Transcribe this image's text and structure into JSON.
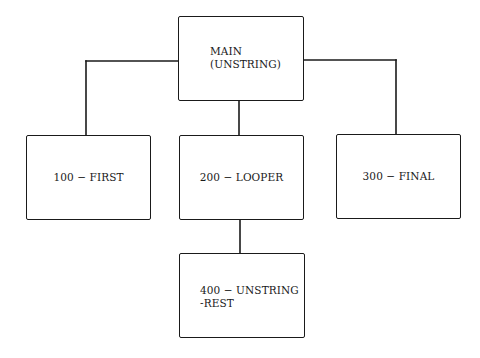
{
  "diagram": {
    "type": "hierarchy-chart",
    "nodes": [
      {
        "id": "main",
        "label": "MAIN\n(UNSTRING)",
        "parent": null
      },
      {
        "id": "first",
        "label": "100 − FIRST",
        "parent": "main"
      },
      {
        "id": "looper",
        "label": "200 − LOOPER",
        "parent": "main"
      },
      {
        "id": "final",
        "label": "300 − FINAL",
        "parent": "main"
      },
      {
        "id": "unstring_rest",
        "label": "400 − UNSTRING\n-REST",
        "parent": "looper"
      }
    ],
    "edges": [
      {
        "from": "main",
        "to": "first"
      },
      {
        "from": "main",
        "to": "looper"
      },
      {
        "from": "main",
        "to": "final"
      },
      {
        "from": "looper",
        "to": "unstring_rest"
      }
    ]
  }
}
